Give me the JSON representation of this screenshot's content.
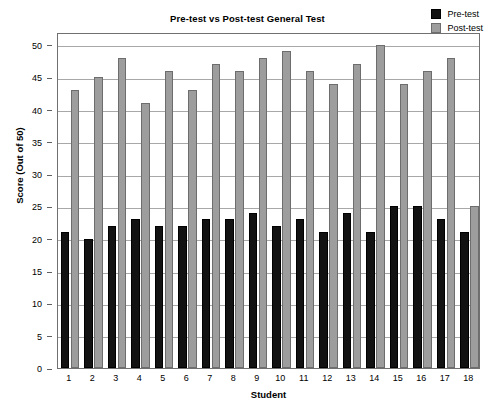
{
  "chart_data": {
    "type": "bar",
    "title": "Pre-test vs Post-test General Test",
    "xlabel": "Student",
    "ylabel": "Score (Out of 50)",
    "categories": [
      "1",
      "2",
      "3",
      "4",
      "5",
      "6",
      "7",
      "8",
      "9",
      "10",
      "11",
      "12",
      "13",
      "14",
      "15",
      "16",
      "17",
      "18"
    ],
    "series": [
      {
        "name": "Pre-test",
        "color": "#121212",
        "values": [
          21,
          20,
          22,
          23,
          22,
          22,
          23,
          23,
          24,
          22,
          23,
          21,
          24,
          21,
          25,
          25,
          23,
          21
        ]
      },
      {
        "name": "Post-test",
        "color": "#9d9d9d",
        "values": [
          43,
          45,
          48,
          41,
          46,
          43,
          47,
          46,
          48,
          49,
          46,
          44,
          47,
          50,
          44,
          46,
          48,
          25
        ]
      }
    ],
    "ylim": [
      0,
      52
    ],
    "yticks": [
      0,
      5,
      10,
      15,
      20,
      25,
      30,
      35,
      40,
      45,
      50
    ],
    "ytick_labels": [
      "0",
      "5",
      "10",
      "15",
      "20",
      "25",
      "30",
      "35",
      "40",
      "45",
      "50"
    ],
    "grid": "horizontal",
    "legend_position": "top-right"
  },
  "legend": {
    "items": [
      {
        "label": "Pre-test",
        "swatch": "pre"
      },
      {
        "label": "Post-test",
        "swatch": "post"
      }
    ]
  }
}
